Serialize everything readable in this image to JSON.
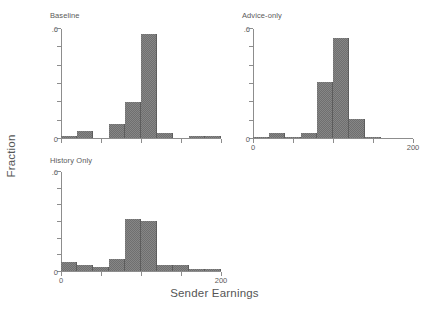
{
  "figure": {
    "ylabel": "Fraction",
    "xlabel": "Sender Earnings"
  },
  "panels": [
    {
      "title": "Baseline"
    },
    {
      "title": "Advice-only"
    },
    {
      "title": "History Only"
    }
  ],
  "axis": {
    "y_tick_labels": {
      "min": "0",
      "max": ".6"
    },
    "x_tick_labels": {
      "min": "0",
      "max": "200"
    }
  },
  "style": {
    "bar_color": "#6f6f6f",
    "axis_color": "#8d8d8d",
    "text_color": "#5a5a5a",
    "background": "#ffffff"
  },
  "chart_data": {
    "type": "bar",
    "title": "",
    "subtitle": "",
    "xlabel": "Sender Earnings",
    "ylabel": "Fraction",
    "xlim": [
      0,
      200
    ],
    "ylim": [
      0,
      0.6
    ],
    "y_ticks": [
      0,
      0.1,
      0.2,
      0.3,
      0.4,
      0.5,
      0.6
    ],
    "y_tick_labels": [
      "0",
      "",
      "",
      "",
      "",
      "",
      ".6"
    ],
    "x_ticks": [
      0,
      50,
      100,
      150,
      200
    ],
    "x_tick_labels": [
      "0",
      "",
      "",
      "",
      "200"
    ],
    "grid": false,
    "legend": null,
    "bin_width": 20,
    "panels": [
      {
        "name": "Baseline",
        "bins": [
          0,
          20,
          40,
          60,
          80,
          100,
          120,
          140,
          160,
          180
        ],
        "values": [
          0.012,
          0.037,
          0.0,
          0.075,
          0.195,
          0.565,
          0.025,
          0.0,
          0.012,
          0.012
        ]
      },
      {
        "name": "Advice-only",
        "bins": [
          0,
          20,
          40,
          60,
          80,
          100,
          120,
          140,
          160
        ],
        "values": [
          0.008,
          0.026,
          0.008,
          0.027,
          0.305,
          0.545,
          0.105,
          0.008,
          0.0
        ]
      },
      {
        "name": "History Only",
        "bins": [
          0,
          20,
          40,
          60,
          80,
          100,
          120,
          140,
          160,
          180
        ],
        "values": [
          0.052,
          0.035,
          0.022,
          0.072,
          0.315,
          0.3,
          0.038,
          0.038,
          0.01,
          0.012
        ]
      }
    ]
  }
}
